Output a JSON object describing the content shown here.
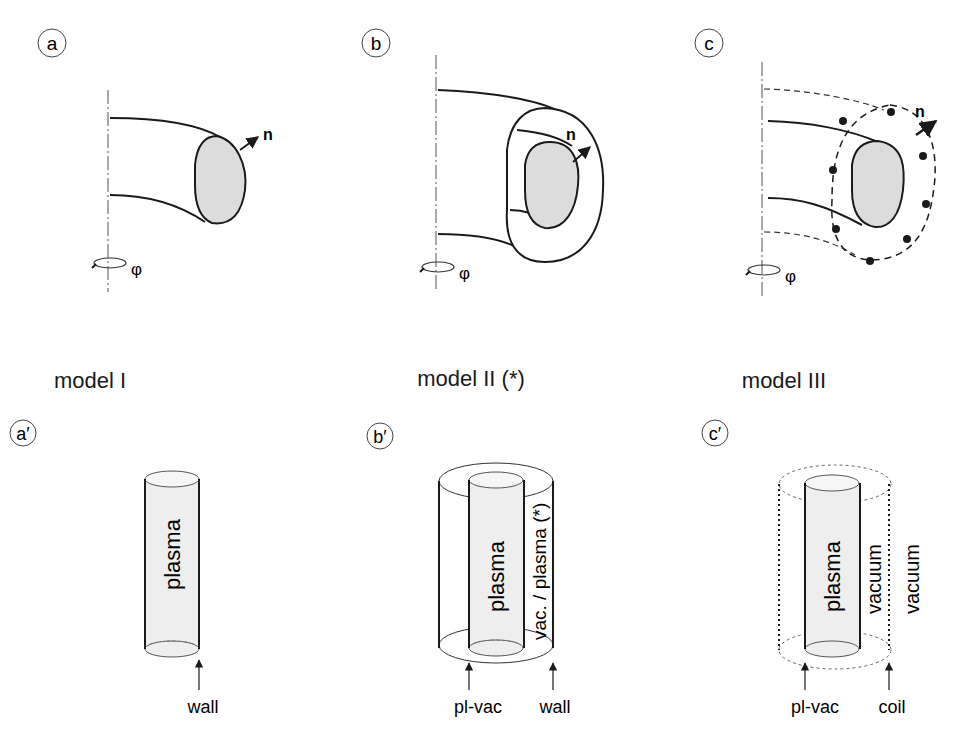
{
  "panels_top": [
    {
      "id": "a",
      "label": "a",
      "normal": "n",
      "angle": "φ"
    },
    {
      "id": "b",
      "label": "b",
      "normal": "n",
      "angle": "φ"
    },
    {
      "id": "c",
      "label": "c",
      "normal": "n",
      "angle": "φ"
    }
  ],
  "models": [
    {
      "label": "model I"
    },
    {
      "label": "model II (*)"
    },
    {
      "label": "model III"
    }
  ],
  "panels_bottom": [
    {
      "id": "a_prime",
      "label": "a′",
      "inner_text": "plasma",
      "arrows": [
        "wall"
      ]
    },
    {
      "id": "b_prime",
      "label": "b′",
      "inner_text": "plasma",
      "gap_text": "vac. / plasma (*)",
      "arrows": [
        "pl-vac",
        "wall"
      ]
    },
    {
      "id": "c_prime",
      "label": "c′",
      "inner_text": "plasma",
      "gap_text": "vacuum",
      "outer_text": "vacuum",
      "arrows": [
        "pl-vac",
        "coil"
      ]
    }
  ],
  "colors": {
    "stroke": "#1a1a1a",
    "plasma_fill": "#dcdcdc",
    "cylinder_fill": "#eeeeee"
  }
}
